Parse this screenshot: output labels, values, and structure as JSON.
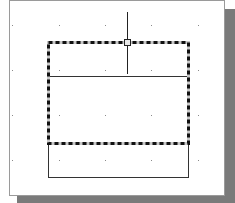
{
  "canvas": {
    "background": "#ffffff",
    "border_color": "#9a9a9a",
    "shadow_color": "#7a7a7a",
    "grid": {
      "dot_color": "#8a8a8a",
      "xs": [
        12,
        59,
        105,
        151,
        198
      ],
      "ys": [
        25,
        70,
        115,
        160
      ]
    }
  },
  "shapes": {
    "selected_rect": {
      "x": 48,
      "y": 42,
      "width": 140,
      "height": 101,
      "state": "selected"
    },
    "divider_line": {
      "x1": 48,
      "y1": 76,
      "x2": 188,
      "y2": 76
    },
    "lower_rect": {
      "x": 48,
      "y": 143,
      "width": 140,
      "height": 34
    },
    "crosshair": {
      "x": 127,
      "y1": 12,
      "y2": 74
    },
    "grip": {
      "x": 127,
      "y": 42,
      "size": 6
    }
  }
}
